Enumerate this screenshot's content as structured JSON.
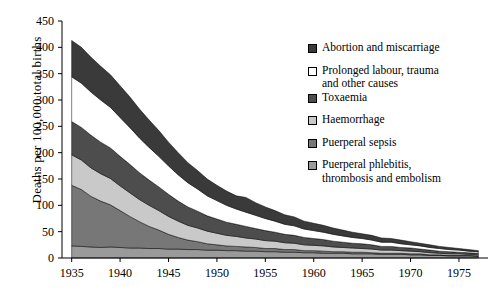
{
  "chart_data": {
    "type": "area",
    "title": "",
    "xlabel": "",
    "ylabel": "Deaths per 100,000 total births",
    "xlim": [
      1934,
      1978
    ],
    "ylim": [
      0,
      450
    ],
    "grid": false,
    "stacked": true,
    "legend_position": "right",
    "xticks": [
      "1935",
      "1940",
      "1945",
      "1950",
      "1955",
      "1960",
      "1965",
      "1970",
      "1975"
    ],
    "yticks": [
      "0",
      "50",
      "100",
      "150",
      "200",
      "250",
      "300",
      "350",
      "400",
      "450"
    ],
    "x": [
      1935,
      1936,
      1937,
      1938,
      1939,
      1940,
      1941,
      1942,
      1943,
      1944,
      1945,
      1946,
      1947,
      1948,
      1949,
      1950,
      1951,
      1952,
      1953,
      1954,
      1955,
      1956,
      1957,
      1958,
      1959,
      1960,
      1961,
      1962,
      1963,
      1964,
      1965,
      1966,
      1967,
      1968,
      1969,
      1970,
      1971,
      1972,
      1973,
      1974,
      1975,
      1976,
      1977
    ],
    "series": [
      {
        "name": "Puerperal phlebitis, thrombosis and embolism",
        "color": "#9a9a9a",
        "values": [
          23,
          22,
          21,
          20,
          21,
          20,
          19,
          19,
          18,
          18,
          17,
          17,
          16,
          16,
          15,
          15,
          14,
          14,
          13,
          13,
          12,
          12,
          11,
          11,
          10,
          10,
          9,
          9,
          9,
          8,
          8,
          8,
          7,
          7,
          7,
          6,
          6,
          5,
          5,
          4,
          4,
          4,
          3
        ]
      },
      {
        "name": "Puerperal sepsis",
        "color": "#777777",
        "values": [
          115,
          108,
          96,
          88,
          80,
          70,
          60,
          50,
          42,
          35,
          28,
          22,
          18,
          15,
          12,
          10,
          9,
          8,
          8,
          7,
          6,
          6,
          5,
          5,
          4,
          4,
          4,
          3,
          3,
          3,
          3,
          2,
          2,
          2,
          2,
          2,
          2,
          1,
          1,
          1,
          1,
          1,
          1
        ]
      },
      {
        "name": "Haemorrhage",
        "color": "#c9c9c9",
        "values": [
          58,
          56,
          54,
          52,
          50,
          47,
          45,
          42,
          40,
          37,
          34,
          31,
          28,
          26,
          24,
          22,
          20,
          19,
          17,
          16,
          15,
          14,
          13,
          12,
          11,
          10,
          10,
          9,
          8,
          8,
          7,
          7,
          6,
          6,
          5,
          5,
          4,
          4,
          3,
          3,
          3,
          2,
          2
        ]
      },
      {
        "name": "Toxaemia",
        "color": "#4d4d4d",
        "values": [
          63,
          62,
          62,
          60,
          58,
          56,
          54,
          51,
          48,
          45,
          42,
          38,
          35,
          32,
          29,
          27,
          25,
          23,
          22,
          20,
          19,
          17,
          16,
          15,
          14,
          13,
          12,
          11,
          10,
          9,
          9,
          8,
          7,
          7,
          6,
          6,
          5,
          5,
          4,
          4,
          3,
          3,
          3
        ]
      },
      {
        "name": "Prolonged labour, trauma and other causes",
        "color": "#ffffff",
        "values": [
          85,
          84,
          82,
          80,
          77,
          74,
          70,
          66,
          62,
          58,
          54,
          50,
          46,
          42,
          38,
          35,
          32,
          29,
          27,
          25,
          23,
          21,
          19,
          18,
          16,
          15,
          14,
          13,
          12,
          11,
          10,
          9,
          8,
          8,
          7,
          6,
          6,
          5,
          5,
          4,
          4,
          3,
          3
        ]
      },
      {
        "name": "Abortion and miscarriage",
        "color": "#3a3a3a",
        "values": [
          69,
          68,
          66,
          64,
          62,
          60,
          58,
          55,
          52,
          49,
          45,
          42,
          38,
          35,
          32,
          29,
          27,
          25,
          28,
          24,
          22,
          20,
          18,
          17,
          15,
          14,
          13,
          12,
          11,
          10,
          9,
          9,
          8,
          7,
          7,
          6,
          5,
          5,
          4,
          4,
          3,
          3,
          2
        ]
      }
    ]
  },
  "legend": {
    "items": [
      {
        "label": "Abortion and miscarriage",
        "label2": "",
        "swatch": "#3a3a3a"
      },
      {
        "label": "Prolonged labour, trauma",
        "label2": "and other causes",
        "swatch": "#ffffff"
      },
      {
        "label": "Toxaemia",
        "label2": "",
        "swatch": "#4d4d4d"
      },
      {
        "label": "Haemorrhage",
        "label2": "",
        "swatch": "#c9c9c9"
      },
      {
        "label": "Puerperal sepsis",
        "label2": "",
        "swatch": "#777777"
      },
      {
        "label": "Puerperal phlebitis,",
        "label2": "thrombosis and embolism",
        "swatch": "#9a9a9a"
      }
    ]
  }
}
